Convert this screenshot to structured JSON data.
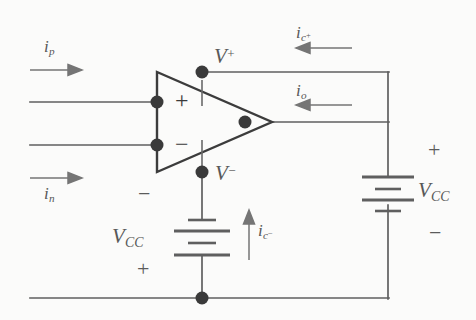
{
  "diagram": {
    "stroke_color": "#5f5f5f",
    "dark_stroke_color": "#3c3c3c",
    "node_color": "#3a3a3a",
    "background": "#fbfbfa"
  },
  "opamp": {
    "plus_terminal": "+",
    "minus_terminal": "−"
  },
  "labels": {
    "v_plus": {
      "base": "V",
      "sup": "+"
    },
    "v_minus": {
      "base": "V",
      "sup": "−"
    },
    "i_p": {
      "base": "i",
      "sub": "p"
    },
    "i_n": {
      "base": "i",
      "sub": "n"
    },
    "i_o": {
      "base": "i",
      "sub": "o"
    },
    "i_c_plus": {
      "base": "i",
      "sub": "c",
      "sub_sup": "+"
    },
    "i_c_minus": {
      "base": "i",
      "sub": "c",
      "sub_sup": "−"
    },
    "vcc_bottom": {
      "base": "V",
      "sub": "CC"
    },
    "vcc_right": {
      "base": "V",
      "sub": "CC"
    }
  },
  "polarity": {
    "bottom_battery_top": "−",
    "bottom_battery_bottom": "+",
    "right_battery_top": "+",
    "right_battery_bottom": "−"
  },
  "arrows": [
    {
      "name": "i-p-arrow",
      "direction": "right"
    },
    {
      "name": "i-n-arrow",
      "direction": "right"
    },
    {
      "name": "i-o-arrow",
      "direction": "left"
    },
    {
      "name": "i-c-plus-arrow",
      "direction": "left"
    },
    {
      "name": "i-c-minus-arrow",
      "direction": "up"
    }
  ]
}
